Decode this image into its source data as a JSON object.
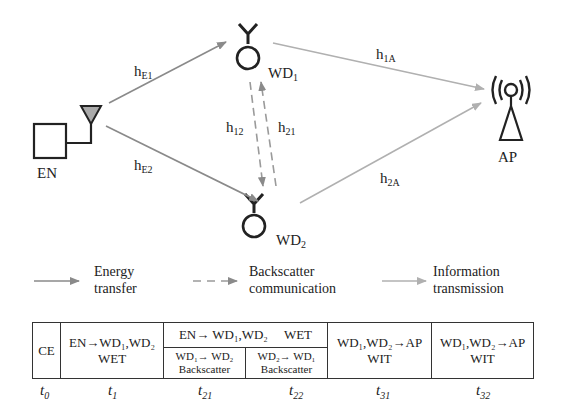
{
  "nodes": {
    "en": {
      "label": "EN"
    },
    "wd1": {
      "label": "WD",
      "sub": "1"
    },
    "wd2": {
      "label": "WD",
      "sub": "2"
    },
    "ap": {
      "label": "AP"
    }
  },
  "channels": {
    "hE1": {
      "label": "h",
      "sub": "E1"
    },
    "hE2": {
      "label": "h",
      "sub": "E2"
    },
    "h12": {
      "label": "h",
      "sub": "12"
    },
    "h21": {
      "label": "h",
      "sub": "21"
    },
    "h1A": {
      "label": "h",
      "sub": "1A"
    },
    "h2A": {
      "label": "h",
      "sub": "2A"
    }
  },
  "legend": [
    {
      "line1": "Energy",
      "line2": "transfer",
      "style": "solid-dark"
    },
    {
      "line1": "Backscatter",
      "line2": "communication",
      "style": "dashed"
    },
    {
      "line1": "Information",
      "line2": "transmission",
      "style": "solid-light"
    }
  ],
  "timeline": {
    "ce": "CE",
    "t1": {
      "line1": "EN→WD₁,WD₂",
      "line2": "WET"
    },
    "t2_top": "EN→ WD₁,WD₂     WET",
    "t21": {
      "line1": "WD₁→ WD₂",
      "line2": "Backscatter"
    },
    "t22": {
      "line1": "WD₂→ WD₁",
      "line2": "Backscatter"
    },
    "t31": {
      "line1": "WD₁,WD₂→AP",
      "line2": "WIT"
    },
    "t32": {
      "line1": "WD₁,WD₂→AP",
      "line2": "WIT"
    },
    "labels": [
      {
        "t": "t",
        "sub": "0"
      },
      {
        "t": "t",
        "sub": "1"
      },
      {
        "t": "t",
        "sub": "21"
      },
      {
        "t": "t",
        "sub": "22"
      },
      {
        "t": "t",
        "sub": "31"
      },
      {
        "t": "t",
        "sub": "32"
      }
    ]
  },
  "colors": {
    "dark_arrow": "#8a8a8a",
    "light_arrow": "#b0b0b0",
    "stroke": "#222222"
  }
}
